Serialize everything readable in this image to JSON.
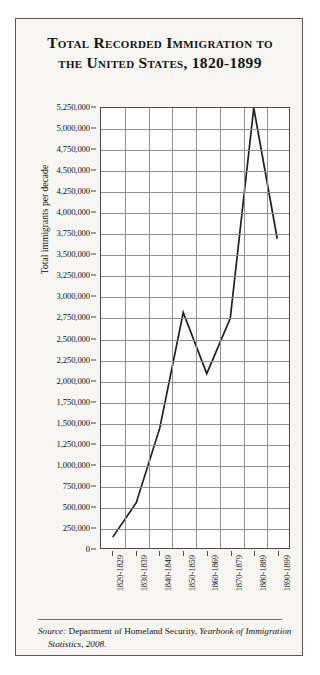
{
  "card": {
    "title_line1": "Total Recorded Immigration to",
    "title_line2": "the United States, 1820-1899",
    "source_prefix": "Source:",
    "source_agency": " Department of Homeland Security, ",
    "source_publication": "Yearbook of Immigration Statistics, 2008."
  },
  "chart_data": {
    "type": "line",
    "title": "Total Recorded Immigration to the United States, 1820-1899",
    "xlabel": "",
    "ylabel": "Total immigrants per decade",
    "categories": [
      "1820-1829",
      "1830-1839",
      "1840-1849",
      "1850-1859",
      "1860-1869",
      "1870-1879",
      "1880-1889",
      "1890-1899"
    ],
    "values": [
      130000,
      540000,
      1430000,
      2810000,
      2080000,
      2740000,
      5250000,
      3690000
    ],
    "ylim": [
      0,
      5250000
    ],
    "ytick_step": 250000,
    "ytick_labels": [
      "5,250,000",
      "5,000,000",
      "4,750,000",
      "4,500,000",
      "4,250,000",
      "4,000,000",
      "3,750,000",
      "3,500,000",
      "3,250,000",
      "3,000,000",
      "2,750,000",
      "2,500,000",
      "2,250,000",
      "2,000,000",
      "1,750,000",
      "1,500,000",
      "1,250,000",
      "1,000,000",
      "750,000",
      "500,000",
      "250,000",
      "0"
    ],
    "grid": true,
    "legend": "none",
    "line_color": "#231f20"
  }
}
